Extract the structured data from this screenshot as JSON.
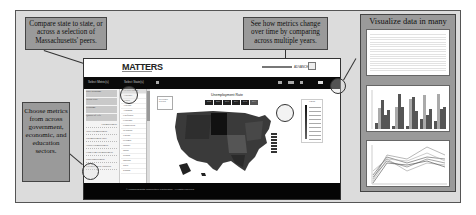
{
  "callouts": {
    "compare": "Compare state to state, or across a selection of Massachusetts' peers.",
    "time": "See how metrics change over time by comparing across multiple years.",
    "metrics": "Choose metrics from across government, economic, and education sectors.",
    "visualize": "Visualize data in many ways"
  },
  "app": {
    "logo": "MATTERS",
    "header_link": "ADVANCED",
    "nav": {
      "select_metrics": "Select Metric(s)",
      "select_states": "Select State(s)"
    },
    "sidebar": {
      "items": [
        "State Rankings",
        "Talent Pool",
        "Economy",
        "Quality of Life"
      ],
      "sub_header": "Unemployment",
      "sub_items": [
        "Total Unemployment",
        "Unemployment Rate",
        "Youth Unemployment",
        "Long-term Unemployment",
        "Underemployment",
        "Unemployment Duration"
      ]
    },
    "states": [
      "All Peer States",
      "Alabama",
      "Alaska",
      "Arizona",
      "Arkansas",
      "California",
      "Colorado",
      "Connecticut",
      "Delaware",
      "Florida",
      "Georgia",
      "Hawaii",
      "Idaho",
      "Illinois",
      "Indiana",
      "Iowa",
      "Kansas"
    ],
    "map_title": "Unemployment Rate",
    "years": [
      "2008",
      "2009",
      "2010",
      "2011",
      "2012",
      "2013"
    ],
    "filter_box": "Peer States Selected",
    "legend_title": "Legend",
    "legend_rows": 9,
    "footer": "© Massachusetts Competitive Partnership. All rights reserved."
  },
  "viz": {
    "table_rows": 16,
    "bar_heights": [
      6,
      22,
      30,
      14,
      20,
      3,
      22,
      35,
      22,
      3,
      30,
      32,
      18,
      10,
      34,
      14,
      20,
      8,
      35,
      20,
      22
    ],
    "line_count": 6
  },
  "colors": {
    "callout": "#9a9a9a",
    "frame": "#dcdcdc",
    "navbar": "#0a0a0a"
  }
}
